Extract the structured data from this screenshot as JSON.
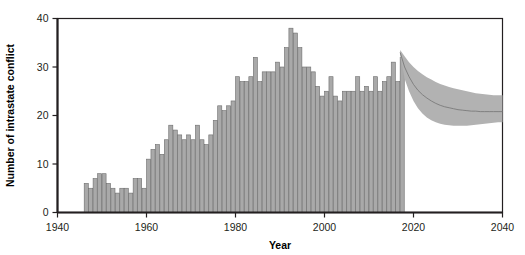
{
  "chart_data": {
    "type": "bar",
    "title": "",
    "subtitle": "",
    "xlabel": "Year",
    "ylabel": "Number of intrastate conflict",
    "xlim": [
      1940,
      2040
    ],
    "ylim": [
      0,
      40
    ],
    "xticks": [
      1940,
      1960,
      1980,
      2000,
      2020,
      2040
    ],
    "xticklabels": [
      "1940",
      "1960",
      "1980",
      "2000",
      "2020",
      "2040"
    ],
    "yticks": [
      0,
      10,
      20,
      30,
      40
    ],
    "yticklabels": [
      "0",
      "10",
      "20",
      "30",
      "40"
    ],
    "grid": false,
    "legend": null,
    "colors": {
      "bar_fill": "#a9a9a9",
      "bar_edge": "#6d6d6d",
      "band_fill": "#b2b2b2",
      "median_line": "#7a7a7a",
      "axis": "#231f20",
      "background": "#ffffff"
    },
    "series": [
      {
        "name": "Observed intrastate conflicts",
        "type": "bar",
        "x": [
          1946,
          1947,
          1948,
          1949,
          1950,
          1951,
          1952,
          1953,
          1954,
          1955,
          1956,
          1957,
          1958,
          1959,
          1960,
          1961,
          1962,
          1963,
          1964,
          1965,
          1966,
          1967,
          1968,
          1969,
          1970,
          1971,
          1972,
          1973,
          1974,
          1975,
          1976,
          1977,
          1978,
          1979,
          1980,
          1981,
          1982,
          1983,
          1984,
          1985,
          1986,
          1987,
          1988,
          1989,
          1990,
          1991,
          1992,
          1993,
          1994,
          1995,
          1996,
          1997,
          1998,
          1999,
          2000,
          2001,
          2002,
          2003,
          2004,
          2005,
          2006,
          2007,
          2008,
          2009,
          2010,
          2011,
          2012,
          2013,
          2014,
          2015,
          2016,
          2017
        ],
        "values": [
          6,
          5,
          7,
          8,
          8,
          6,
          5,
          4,
          5,
          5,
          4,
          7,
          7,
          5,
          11,
          13,
          14,
          12,
          15,
          18,
          17,
          16,
          15,
          16,
          15,
          18,
          15,
          14,
          16,
          19,
          22,
          21,
          22,
          23,
          28,
          27,
          27,
          28,
          32,
          27,
          29,
          29,
          29,
          31,
          30,
          34,
          38,
          37,
          34,
          30,
          30,
          29,
          26,
          24,
          25,
          28,
          24,
          23,
          25,
          25,
          25,
          28,
          25,
          26,
          25,
          28,
          25,
          27,
          28,
          31,
          27,
          32
        ]
      },
      {
        "name": "Projected median",
        "type": "line",
        "x": [
          2017,
          2018,
          2019,
          2020,
          2021,
          2022,
          2023,
          2024,
          2025,
          2026,
          2027,
          2028,
          2029,
          2030,
          2031,
          2032,
          2033,
          2034,
          2035,
          2036,
          2037,
          2038,
          2039,
          2040
        ],
        "values": [
          33.0,
          30.0,
          28.0,
          26.4,
          25.2,
          24.3,
          23.6,
          23.0,
          22.5,
          22.1,
          21.8,
          21.6,
          21.4,
          21.2,
          21.1,
          21.0,
          20.9,
          20.9,
          20.8,
          20.8,
          20.8,
          20.8,
          20.8,
          20.8
        ]
      },
      {
        "name": "Projection uncertainty band",
        "type": "band",
        "x": [
          2017,
          2018,
          2019,
          2020,
          2021,
          2022,
          2023,
          2024,
          2025,
          2026,
          2027,
          2028,
          2029,
          2030,
          2031,
          2032,
          2033,
          2034,
          2035,
          2036,
          2037,
          2038,
          2039,
          2040
        ],
        "upper": [
          33.5,
          32.2,
          31.0,
          30.0,
          29.2,
          28.5,
          27.9,
          27.4,
          26.9,
          26.5,
          26.2,
          25.9,
          25.6,
          25.4,
          25.2,
          25.0,
          24.8,
          24.6,
          24.5,
          24.4,
          24.3,
          24.2,
          24.2,
          24.2
        ],
        "lower": [
          32.5,
          27.6,
          25.0,
          23.0,
          21.5,
          20.4,
          19.6,
          19.0,
          18.6,
          18.3,
          18.1,
          18.0,
          17.9,
          17.9,
          17.9,
          17.9,
          18.0,
          18.1,
          18.2,
          18.3,
          18.4,
          18.5,
          18.6,
          18.6
        ]
      }
    ]
  }
}
